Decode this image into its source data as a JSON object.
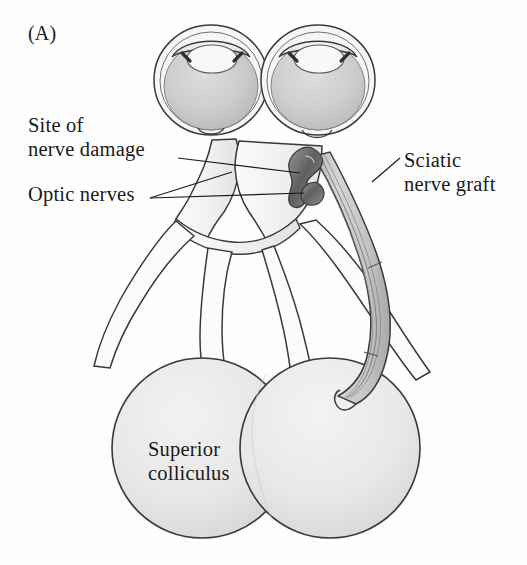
{
  "figure": {
    "panel_label": "(A)",
    "background_color": "#fefefe",
    "ink_color": "#3a3a3a",
    "text_color": "#1a1a1a"
  },
  "labels": {
    "site_of_nerve_damage": "Site of\nnerve damage",
    "optic_nerves": "Optic nerves",
    "sciatic_nerve_graft": "Sciatic\nnerve graft",
    "superior_colliculus": "Superior\ncolliculus"
  },
  "structures": {
    "left_eye": "left-eye",
    "right_eye": "right-eye",
    "optic_chiasm": "optic-chiasm",
    "damage_site": "damage-site",
    "graft_bundle": "sciatic-nerve-graft",
    "left_colliculus": "left-superior-colliculus",
    "right_colliculus": "right-superior-colliculus"
  },
  "colors": {
    "sclera_fill": "#f4f4f4",
    "vitreous_fill": "#cfcfcf",
    "lens_fill": "#f7f7f7",
    "nerve_fill": "#f2f2f2",
    "graft_fill": "#c9c9c9",
    "colliculus_fill": "#e6e6e6",
    "damage_dark": "#6e6e6e",
    "outline": "#3a3a3a"
  }
}
